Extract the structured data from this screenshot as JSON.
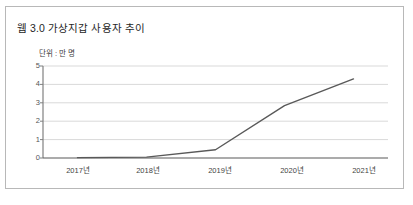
{
  "figure": {
    "background_color": "#ffffff",
    "border_color": "#b8b8b8"
  },
  "chart_data": {
    "type": "line",
    "title": "웹 3.0 가상지갑 사용자 추이",
    "subtitle": "단위 : 만 명",
    "xlabel": "",
    "ylabel": "",
    "categories": [
      "2017년",
      "2018년",
      "2019년",
      "2020년",
      "2021년"
    ],
    "values": [
      0.02,
      0.05,
      0.45,
      2.85,
      4.3
    ],
    "series": [
      {
        "name": "웹 3.0 가상지갑 사용자",
        "values": [
          0.02,
          0.05,
          0.45,
          2.85,
          4.3
        ],
        "color": "#595959"
      }
    ],
    "ylim": [
      0,
      5
    ],
    "yticks": [
      "0",
      "1",
      "2",
      "3",
      "4",
      "5"
    ],
    "ytick_values": [
      0,
      1,
      2,
      3,
      4,
      5
    ],
    "grid": true,
    "grid_color": "#d9d9d9",
    "axis_color": "#808080",
    "legend": "none",
    "legend_position": "none"
  }
}
